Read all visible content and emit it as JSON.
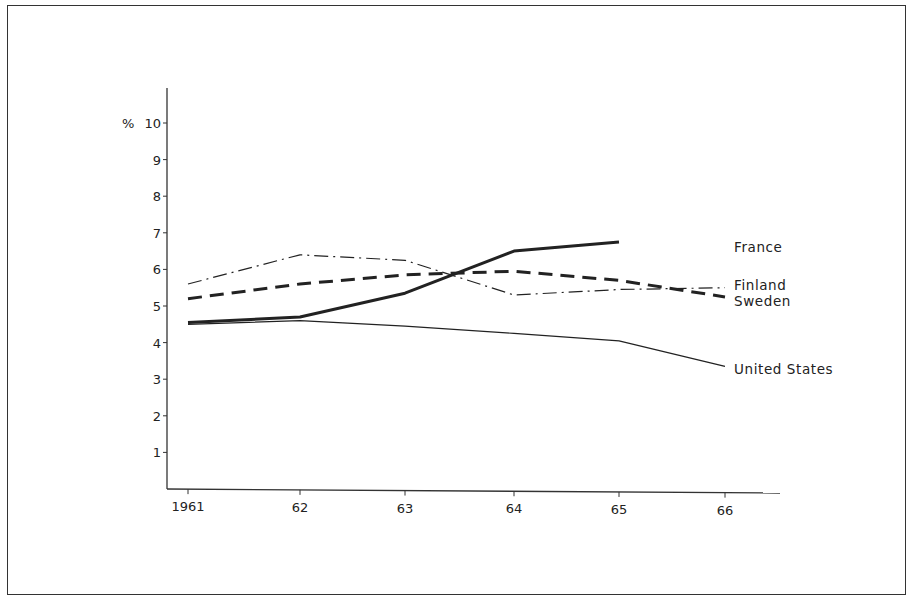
{
  "chart_data": {
    "type": "line",
    "title": "",
    "xlabel": "",
    "ylabel": "%",
    "x": [
      "1961",
      "62",
      "63",
      "64",
      "65",
      "66"
    ],
    "yticks": [
      "1",
      "2",
      "3",
      "4",
      "5",
      "6",
      "7",
      "8",
      "9",
      "10"
    ],
    "y_unit_label": "%",
    "ylim": [
      0,
      10
    ],
    "grid": false,
    "legend_position": "inline labels at right end of lines",
    "series": [
      {
        "name": "France",
        "style": "solid-thick",
        "values": [
          4.55,
          4.7,
          5.35,
          6.5,
          6.75,
          null
        ]
      },
      {
        "name": "Finland",
        "style": "dash-dot",
        "values": [
          5.6,
          6.4,
          6.25,
          5.3,
          5.45,
          5.5
        ]
      },
      {
        "name": "Sweden",
        "style": "dashed-thick",
        "values": [
          5.2,
          5.6,
          5.85,
          5.95,
          5.7,
          5.25
        ]
      },
      {
        "name": "United States",
        "style": "solid-thin",
        "values": [
          4.5,
          4.6,
          4.45,
          4.25,
          4.05,
          3.35
        ]
      }
    ]
  },
  "labels": {
    "france": "France",
    "finland": "Finland",
    "sweden": "Sweden",
    "us": "United States",
    "y_unit": "%"
  }
}
